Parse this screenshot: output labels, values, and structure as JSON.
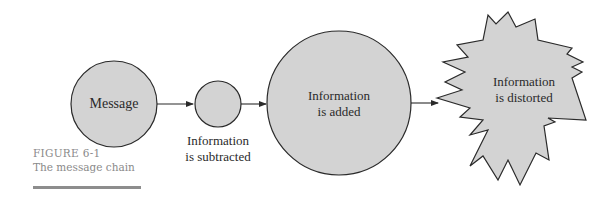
{
  "figure": {
    "number_label": "FIGURE 6-1",
    "title": "The message chain"
  },
  "colors": {
    "shape_fill": "#d3d3d3",
    "shape_stroke": "#2a2a2a",
    "caption_text": "#8a8a8a",
    "rule": "#8d8d8d"
  },
  "nodes": [
    {
      "id": "message",
      "shape": "circle",
      "label_lines": [
        "Message"
      ]
    },
    {
      "id": "subtracted",
      "shape": "circle",
      "label_lines": [
        "Information",
        "is subtracted"
      ],
      "label_position": "below"
    },
    {
      "id": "added",
      "shape": "circle",
      "label_lines": [
        "Information",
        "is added"
      ]
    },
    {
      "id": "distorted",
      "shape": "starburst",
      "label_lines": [
        "Information",
        "is distorted"
      ]
    }
  ],
  "edges": [
    {
      "from": "message",
      "to": "subtracted"
    },
    {
      "from": "subtracted",
      "to": "added"
    },
    {
      "from": "added",
      "to": "distorted"
    }
  ]
}
